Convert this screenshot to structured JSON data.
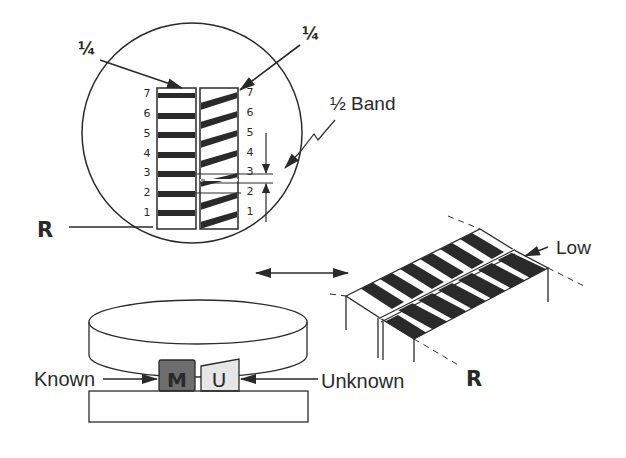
{
  "diagram": {
    "labels": {
      "quarter_left": "¼",
      "quarter_right": "¼",
      "half_band": "½ Band",
      "reference_left": "R",
      "reference_right": "R",
      "low": "Low",
      "known": "Known",
      "unknown": "Unknown",
      "block_known_letter": "M",
      "block_unknown_letter": "U"
    },
    "left_column_numbers": [
      "7",
      "6",
      "5",
      "4",
      "3",
      "2",
      "1"
    ],
    "right_column_numbers": [
      "7",
      "6",
      "5",
      "4",
      "3",
      "2",
      "1"
    ],
    "colors": {
      "ink": "#2a2a2a",
      "known_block": "#6e6e6e",
      "unknown_block": "#e6e6e6",
      "background": "#ffffff"
    }
  }
}
